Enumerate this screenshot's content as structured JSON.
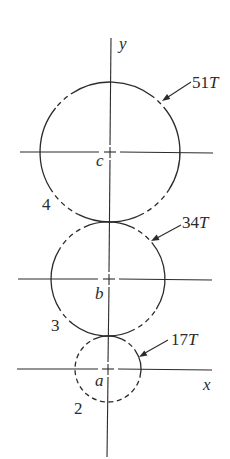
{
  "figure": {
    "axes": {
      "x_label": "x",
      "y_label": "y"
    },
    "gears": [
      {
        "number": "4",
        "center_label": "c",
        "teeth_count": "51",
        "teeth_suffix": "T"
      },
      {
        "number": "3",
        "center_label": "b",
        "teeth_count": "34",
        "teeth_suffix": "T"
      },
      {
        "number": "2",
        "center_label": "a",
        "teeth_count": "17",
        "teeth_suffix": "T"
      }
    ],
    "colors": {
      "line": "#2b2b2b",
      "background": "#ffffff"
    }
  }
}
